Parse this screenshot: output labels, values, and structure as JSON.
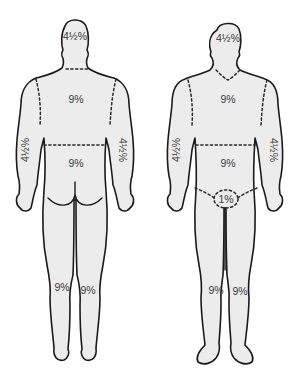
{
  "diagram": {
    "title": "",
    "figures": [
      {
        "view": "posterior",
        "labels": {
          "head": "4½%",
          "upper_trunk": "9%",
          "lower_trunk": "9%",
          "left_arm": "4½%",
          "right_arm": "4½%",
          "left_leg": "9%",
          "right_leg": "9%"
        }
      },
      {
        "view": "anterior",
        "labels": {
          "head": "4½%",
          "upper_trunk": "9%",
          "lower_trunk": "9%",
          "left_arm": "4½%",
          "right_arm": "4½%",
          "perineum": "1%",
          "left_leg": "9%",
          "right_leg": "9%"
        }
      }
    ],
    "colors": {
      "fill": "#ececec",
      "outline": "#1a1a1a",
      "label": "#3a3a3a"
    }
  }
}
